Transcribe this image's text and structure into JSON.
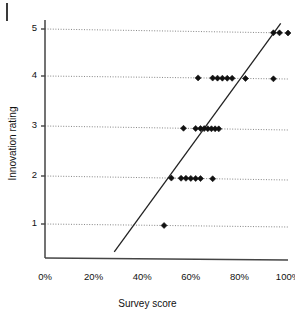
{
  "chart_data": {
    "type": "scatter",
    "title": "",
    "xlabel": "Survey score",
    "ylabel": "Innovation rating",
    "xlim": [
      0,
      100
    ],
    "ylim": [
      0.2,
      5.4
    ],
    "xticks": [
      "0%",
      "20%",
      "40%",
      "60%",
      "80%",
      "100%"
    ],
    "xtick_values": [
      0,
      20,
      40,
      60,
      80,
      100
    ],
    "yticks": [
      "1",
      "2",
      "3",
      "4",
      "5"
    ],
    "ytick_values": [
      1,
      2,
      3,
      4,
      5
    ],
    "grid": "horizontal-dotted",
    "legend": "none",
    "marker": "diamond",
    "marker_color": "#111111",
    "gridline_color": "#777777",
    "axis_color": "#444444",
    "trendline_color": "#222222",
    "points": [
      {
        "x": 49.0,
        "y": 1
      },
      {
        "x": 52.0,
        "y": 2
      },
      {
        "x": 56.0,
        "y": 2
      },
      {
        "x": 58.0,
        "y": 2
      },
      {
        "x": 60.0,
        "y": 2
      },
      {
        "x": 62.0,
        "y": 2
      },
      {
        "x": 64.0,
        "y": 2
      },
      {
        "x": 69.0,
        "y": 2
      },
      {
        "x": 57.0,
        "y": 3
      },
      {
        "x": 62.0,
        "y": 3
      },
      {
        "x": 64.0,
        "y": 3
      },
      {
        "x": 65.5,
        "y": 3
      },
      {
        "x": 67.0,
        "y": 3
      },
      {
        "x": 68.5,
        "y": 3
      },
      {
        "x": 70.0,
        "y": 3
      },
      {
        "x": 71.5,
        "y": 3
      },
      {
        "x": 63.0,
        "y": 4
      },
      {
        "x": 69.0,
        "y": 4
      },
      {
        "x": 71.0,
        "y": 4
      },
      {
        "x": 73.0,
        "y": 4
      },
      {
        "x": 75.0,
        "y": 4
      },
      {
        "x": 77.0,
        "y": 4
      },
      {
        "x": 82.5,
        "y": 4
      },
      {
        "x": 94.0,
        "y": 4
      },
      {
        "x": 94.0,
        "y": 5
      },
      {
        "x": 96.5,
        "y": 5
      },
      {
        "x": 100.0,
        "y": 5
      }
    ],
    "trendline": {
      "x_start": 28.5,
      "y_start": 0.42,
      "x_end": 97.0,
      "y_end": 5.12
    }
  }
}
